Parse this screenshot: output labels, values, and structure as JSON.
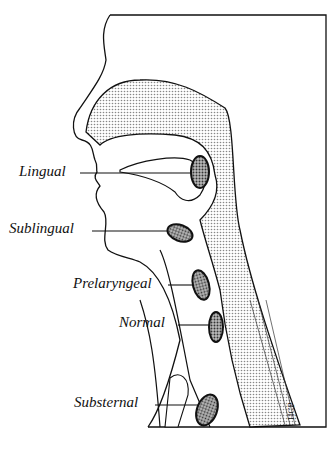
{
  "figure": {
    "labels": [
      {
        "id": "lingual",
        "text": "Lingual"
      },
      {
        "id": "sublingual",
        "text": "Sublingual"
      },
      {
        "id": "prelaryngeal",
        "text": "Prelaryngeal"
      },
      {
        "id": "normal",
        "text": "Normal"
      },
      {
        "id": "substernal",
        "text": "Substernal"
      }
    ],
    "signature": "HCP",
    "colors": {
      "line": "#111111",
      "stipple": "#c8c8c8",
      "gland": "#777777",
      "background": "#ffffff"
    }
  }
}
